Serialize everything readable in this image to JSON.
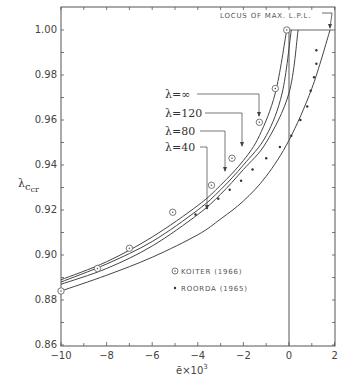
{
  "chart_data": {
    "type": "line",
    "title": "",
    "xlabel": "ē×10³",
    "ylabel": "λ_ccr",
    "xlim": [
      -10,
      2
    ],
    "ylim": [
      0.86,
      1.01
    ],
    "grid": false,
    "x_ticks": [
      "-10",
      "-8",
      "-6",
      "-4",
      "-2",
      "0",
      "2"
    ],
    "y_ticks": [
      "0.86",
      "0.88",
      "0.90",
      "0.92",
      "0.94",
      "0.96",
      "0.98",
      "1.00"
    ],
    "annotation_top": "LOCUS OF MAX. L.P.L.",
    "series": [
      {
        "name": "λ=∞",
        "label": "λ=∞",
        "x": [
          -10,
          -8,
          -6,
          -4,
          -3,
          -2,
          -1.3,
          -0.6,
          -0.1
        ],
        "y": [
          0.889,
          0.897,
          0.908,
          0.922,
          0.931,
          0.942,
          0.953,
          0.972,
          1.0
        ]
      },
      {
        "name": "λ=120",
        "label": "λ=120",
        "x": [
          -10,
          -8,
          -6,
          -4,
          -3,
          -2,
          -1,
          -0.3,
          0.1
        ],
        "y": [
          0.888,
          0.896,
          0.906,
          0.92,
          0.929,
          0.94,
          0.953,
          0.972,
          1.0
        ]
      },
      {
        "name": "λ=80",
        "label": "λ=80",
        "x": [
          -10,
          -8,
          -6,
          -4,
          -3,
          -2,
          -1,
          0,
          0.4
        ],
        "y": [
          0.887,
          0.894,
          0.904,
          0.918,
          0.927,
          0.938,
          0.95,
          0.972,
          1.0
        ]
      },
      {
        "name": "λ=40",
        "label": "λ=40",
        "x": [
          -10,
          -8,
          -6,
          -4,
          -3,
          -2,
          -1,
          0,
          1,
          1.8
        ],
        "y": [
          0.884,
          0.891,
          0.899,
          0.909,
          0.916,
          0.924,
          0.935,
          0.951,
          0.974,
          1.0
        ]
      },
      {
        "name": "KOITER (1966)",
        "marker": "circle-dot",
        "x": [
          -10,
          -8.4,
          -7.0,
          -5.1,
          -3.4,
          -2.5,
          -1.3,
          -0.6,
          -0.1
        ],
        "y": [
          0.884,
          0.894,
          0.903,
          0.919,
          0.931,
          0.943,
          0.959,
          0.974,
          1.0
        ]
      },
      {
        "name": "ROORDA (1965)",
        "marker": "dot",
        "x": [
          -4.1,
          -3.6,
          -3.1,
          -2.6,
          -2.1,
          -1.6,
          -1.0,
          -0.4,
          0.1,
          0.5,
          0.8,
          0.95,
          1.1,
          1.2,
          1.2
        ],
        "y": [
          0.918,
          0.921,
          0.925,
          0.929,
          0.933,
          0.938,
          0.943,
          0.948,
          0.953,
          0.96,
          0.966,
          0.973,
          0.979,
          0.985,
          0.991
        ]
      }
    ],
    "legend": [
      {
        "symbol": "⊙",
        "label": "KOITER (1966)"
      },
      {
        "symbol": "•",
        "label": "ROORDA (1965)"
      }
    ],
    "vertical_line_x": 0,
    "legend_position": "lower-center"
  },
  "labels": {
    "lam_inf": "λ=∞",
    "lam_120": "λ=120",
    "lam_80": "λ=80",
    "lam_40": "λ=40",
    "locus": "LOCUS OF MAX. L.P.L.",
    "legend_koiter": "KOITER (1966)",
    "legend_roorda": "ROORDA (1965)",
    "xlabel_main": "ē×10",
    "xlabel_sup": "3",
    "ylabel_main": "λ",
    "ylabel_sub": "c",
    "ylabel_subsub": "cr"
  }
}
